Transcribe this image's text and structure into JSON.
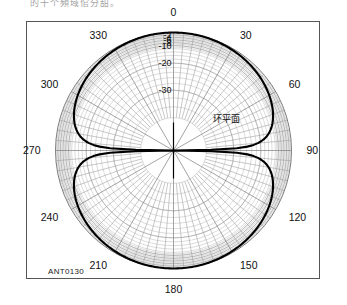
{
  "page": {
    "top_caption": "的十个頻域倌分甜。",
    "plot_id": "ANT0130"
  },
  "chart_data": {
    "type": "line",
    "plot_style": "polar",
    "title": "",
    "annotation": "环平面",
    "angle_unit": "degrees",
    "angle_direction": "clockwise",
    "angle_zero_at": "top",
    "angle_ticks": [
      0,
      30,
      60,
      90,
      120,
      150,
      180,
      210,
      240,
      270,
      300,
      330
    ],
    "angle_tick_labels": [
      "0",
      "30",
      "60",
      "90",
      "120",
      "150",
      "180",
      "210",
      "240",
      "270",
      "300",
      "330"
    ],
    "radial_unit": "dB",
    "radial_tick_labels": [
      "-2",
      "-4",
      "-6",
      "-8",
      "-10",
      "-20",
      "-30"
    ],
    "radial_ticks_db": [
      -2,
      -4,
      -6,
      -8,
      -10,
      -20,
      -30
    ],
    "radial_max_db": 0,
    "radial_min_db": -40,
    "radial_scale": "compressed-nonlinear",
    "grid": true,
    "legend": "none",
    "series": [
      {
        "name": "环平面",
        "pattern": "figure-eight-dipole",
        "main_lobe_angles_deg": [
          0,
          180
        ],
        "null_angles_deg": [
          90,
          270
        ],
        "peak_db": 0,
        "angles_deg": [
          0,
          10,
          20,
          30,
          40,
          50,
          60,
          70,
          80,
          85,
          90,
          95,
          100,
          110,
          120,
          130,
          140,
          150,
          160,
          170,
          180,
          190,
          200,
          210,
          220,
          230,
          240,
          250,
          260,
          270,
          275,
          280,
          290,
          300,
          310,
          320,
          330,
          340,
          350,
          360
        ],
        "values_db": [
          0,
          -0.13,
          -0.54,
          -1.25,
          -2.33,
          -3.83,
          -6.02,
          -9.31,
          -15.2,
          -21.2,
          -40,
          -21.2,
          -15.2,
          -9.31,
          -6.02,
          -3.83,
          -2.33,
          -1.25,
          -0.54,
          -0.13,
          0,
          -0.13,
          -0.54,
          -1.25,
          -2.33,
          -3.83,
          -6.02,
          -9.31,
          -15.2,
          -40,
          -21.2,
          -15.2,
          -9.31,
          -6.02,
          -3.83,
          -2.33,
          -1.25,
          -0.54,
          -0.13,
          0
        ]
      }
    ]
  }
}
